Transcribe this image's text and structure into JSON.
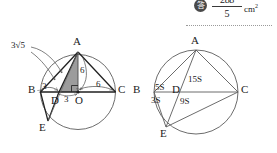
{
  "answer": {
    "badge": "答",
    "numerator": "288",
    "denominator": "5",
    "unit": "cm",
    "unit_exp": "2"
  },
  "figures": [
    {
      "name": "left-figure",
      "kind": "circle-with-inscribed-triangle-and-measurements",
      "vertices": [
        {
          "id": "A",
          "label": "A"
        },
        {
          "id": "B",
          "label": "B"
        },
        {
          "id": "C",
          "label": "C"
        },
        {
          "id": "D",
          "label": "D"
        },
        {
          "id": "E",
          "label": "E"
        },
        {
          "id": "O",
          "label": "O"
        }
      ],
      "measures": [
        {
          "id": "chord-ad",
          "label": "3√5"
        },
        {
          "id": "bd",
          "label": "3"
        },
        {
          "id": "do",
          "label": "3"
        },
        {
          "id": "ao",
          "label": "6"
        },
        {
          "id": "oc",
          "label": "6"
        }
      ],
      "shaded_region": "triangle-ADO",
      "right_angle_at": "O"
    },
    {
      "name": "right-figure",
      "kind": "circle-with-area-ratio-labels",
      "vertices": [
        {
          "id": "A",
          "label": "A"
        },
        {
          "id": "B",
          "label": "B"
        },
        {
          "id": "C",
          "label": "C"
        },
        {
          "id": "D",
          "label": "D"
        },
        {
          "id": "E",
          "label": "E"
        }
      ],
      "areas": [
        {
          "id": "abd",
          "label": "5S"
        },
        {
          "id": "adc",
          "label": "15S"
        },
        {
          "id": "bde",
          "label": "3S"
        },
        {
          "id": "dec",
          "label": "9S"
        }
      ]
    }
  ],
  "colors": {
    "stroke": "#3a3a3a",
    "shade_fill": "#9c9c9c",
    "badge_bg": "#4a4a4a",
    "rule": "#9a9a9a"
  }
}
